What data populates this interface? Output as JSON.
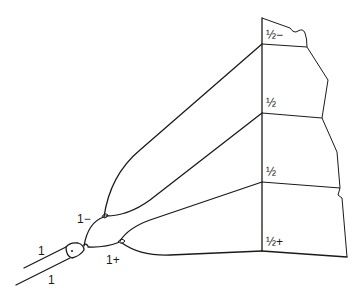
{
  "diagram": {
    "type": "branching-tree-to-segmented-column",
    "stroke_color": "#1a1a1a",
    "background": "#ffffff",
    "root": {
      "labels": [
        "1",
        "1"
      ]
    },
    "level1": {
      "upper_label": "1−",
      "lower_label": "1+"
    },
    "column_segments": [
      {
        "label": "½−"
      },
      {
        "label": "½"
      },
      {
        "label": "½"
      },
      {
        "label": "½+"
      }
    ]
  }
}
